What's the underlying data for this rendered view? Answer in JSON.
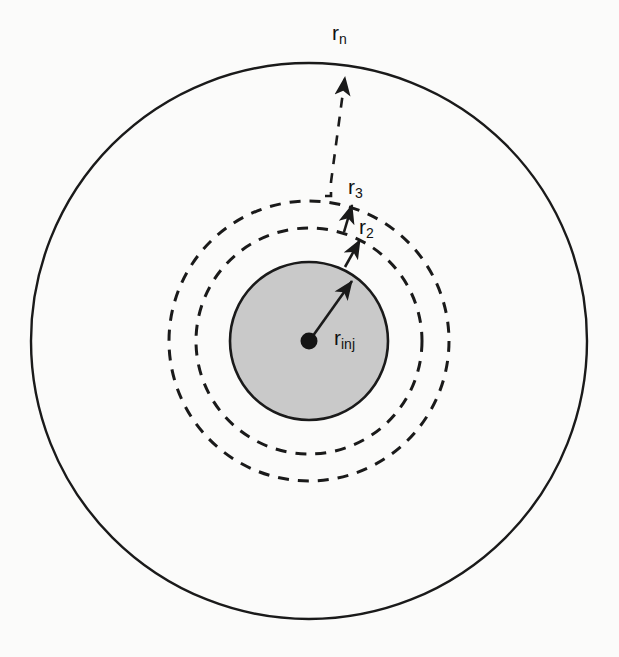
{
  "figure": {
    "kind": "concentric-radial-zone-diagram",
    "background_color": "#fbfbfa",
    "line_color": "#1a1a1a",
    "shaded_fill_color": "#c9c9c9",
    "center": {
      "x": 309,
      "y": 341
    },
    "labels": {
      "r_n": {
        "base": "r",
        "sub": "n"
      },
      "r_3": {
        "base": "r",
        "sub": "3"
      },
      "r_2": {
        "base": "r",
        "sub": "2"
      },
      "r_inj": {
        "base": "r",
        "sub": "inj"
      }
    },
    "circles": [
      {
        "name": "outer-boundary-circle",
        "label_key": "r_n",
        "radius": 278,
        "style": "solid",
        "fill": "none"
      },
      {
        "name": "zone-3-circle",
        "label_key": "r_3",
        "radius": 140,
        "style": "dashed",
        "fill": "none"
      },
      {
        "name": "zone-2-circle",
        "label_key": "r_2",
        "radius": 113,
        "style": "dashed",
        "fill": "none"
      },
      {
        "name": "injection-circle",
        "label_key": "r_inj",
        "radius": 79,
        "style": "solid",
        "fill": "#c9c9c9"
      }
    ],
    "center_dot": {
      "name": "injection-point",
      "radius": 8
    },
    "leaders": [
      {
        "name": "rn-leader",
        "style": "dashed",
        "arrow": true
      },
      {
        "name": "r3-leader",
        "style": "solid",
        "arrow": true
      },
      {
        "name": "r2-leader",
        "style": "solid",
        "arrow": true
      },
      {
        "name": "rinj-leader",
        "style": "solid",
        "arrow": true
      }
    ]
  }
}
